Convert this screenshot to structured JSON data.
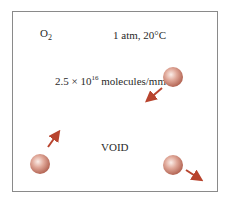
{
  "labels": {
    "species": "O",
    "species_sub": "2",
    "conditions": "1 atm, 20°C",
    "density_base": "2.5 × 10",
    "density_exp": "16",
    "density_unit": " molecules/mm",
    "density_unit_exp": "3",
    "void": "VOID"
  },
  "colors": {
    "sphere": "#c97a6a",
    "arrow": "#b8442e",
    "border": "#8a8a8a"
  }
}
